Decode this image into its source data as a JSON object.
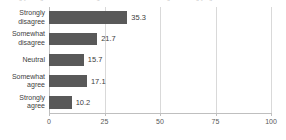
{
  "header": {
    "cutoff_text": "Strongly disagree    Somewhat disagree    Neutral    Somewhat agree    Strongly agree    Total"
  },
  "chart_data": {
    "type": "bar",
    "orientation": "horizontal",
    "title": "",
    "xlabel": "",
    "ylabel": "",
    "categories": [
      "Strongly disagree",
      "Somewhat disagree",
      "Neutral",
      "Somewhat agree",
      "Strongly agree"
    ],
    "values": [
      35.3,
      21.7,
      15.7,
      17.1,
      10.2
    ],
    "value_labels": [
      "35.3",
      "21.7",
      "15.7",
      "17.1",
      "10.2"
    ],
    "xlim": [
      0,
      100
    ],
    "xticks": [
      0,
      25,
      50,
      75,
      100
    ],
    "xtick_labels": [
      "0",
      "25",
      "50",
      "75",
      "100"
    ],
    "grid": true,
    "grid_axis": "x",
    "legend": false,
    "bar_color": "#595959",
    "grid_color": "#d9d9d9",
    "axis_color": "#bfbfbf",
    "text_color": "#404040",
    "background": "#ffffff"
  }
}
